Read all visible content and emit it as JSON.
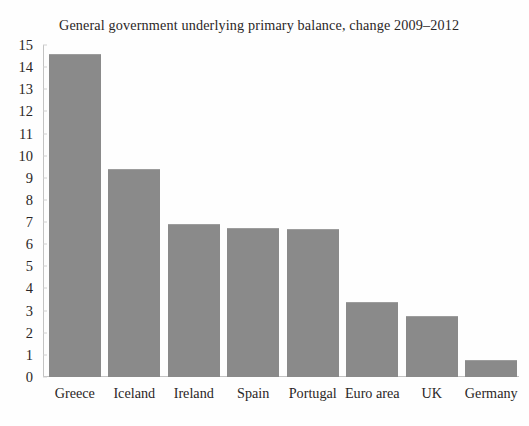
{
  "chart_data": {
    "type": "bar",
    "title": "General government underlying primary balance, change 2009–2012",
    "xlabel": "",
    "ylabel": "",
    "categories": [
      "Greece",
      "Iceland",
      "Ireland",
      "Spain",
      "Portugal",
      "Euro area",
      "UK",
      "Germany"
    ],
    "values": [
      14.6,
      9.4,
      6.9,
      6.75,
      6.7,
      3.4,
      2.75,
      0.75
    ],
    "ylim": [
      0,
      15
    ],
    "y_ticks": [
      0,
      1,
      2,
      3,
      4,
      5,
      6,
      7,
      8,
      9,
      10,
      11,
      12,
      13,
      14,
      15
    ],
    "y_tick_labels": [
      "0",
      "1",
      "2",
      "3",
      "4",
      "5",
      "6",
      "7",
      "8",
      "9",
      "10",
      "11",
      "12",
      "13",
      "14",
      "15"
    ],
    "grid": false,
    "legend": null,
    "legend_position": "none",
    "bar_color": "#8a8a8a",
    "axis_color": "#c3c3c3",
    "background_color": "#fefefe",
    "text_color": "#2a2626"
  }
}
